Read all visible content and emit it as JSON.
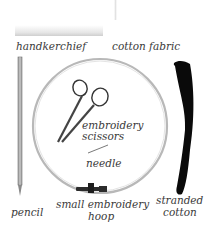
{
  "labels": {
    "handkerchief": "handkerchief",
    "cotton_fabric": "cotton fabric",
    "scissors_line1": "embroidery",
    "scissors_line2": "scissors",
    "needle": "needle",
    "pencil": "pencil",
    "hoop_line1": "small embroidery",
    "hoop_line2": "hoop",
    "thread_line1": "stranded",
    "thread_line2": "cotton"
  },
  "colors": {
    "background": "#ffffff",
    "text": "#3a3a3a",
    "hoop": "#b8b8b8",
    "thread": "#0a0a0a",
    "pencil": "#9a9a9a"
  }
}
